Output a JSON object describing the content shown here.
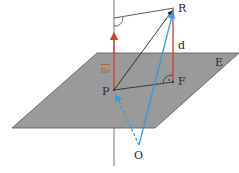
{
  "diagram": {
    "type": "geometry-3d",
    "labels": {
      "R": "R",
      "d": "d",
      "E": "E",
      "F": "F",
      "P": "P",
      "O": "O",
      "normal_vector": "n₀"
    },
    "colors": {
      "plane_fill": "#9a9a9a",
      "plane_edge": "#555555",
      "normal_red": "#d9452b",
      "vector_blue": "#3a9ad9",
      "line_black": "#222222",
      "label_text": "#2a2a2a",
      "normal_label": "#b5652a"
    },
    "points": {
      "P": [
        114,
        90
      ],
      "F": [
        173,
        82
      ],
      "R": [
        174,
        8
      ],
      "O": [
        139,
        145
      ],
      "normal_tip": [
        114,
        30
      ]
    },
    "plane_corners": [
      [
        97,
        53
      ],
      [
        239,
        53
      ],
      [
        155,
        128
      ],
      [
        12,
        128
      ]
    ]
  }
}
